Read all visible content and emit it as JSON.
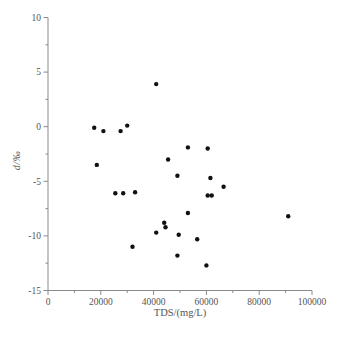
{
  "figure": {
    "background": "#ffffff"
  },
  "chart_data": {
    "type": "scatter",
    "title": "",
    "xlabel": "TDS/(mg/L)",
    "ylabel": "d/‰",
    "xlim": [
      0,
      100000
    ],
    "ylim": [
      -15,
      10
    ],
    "x_major_ticks": [
      0,
      20000,
      40000,
      60000,
      80000,
      100000
    ],
    "x_minor_ticks": [
      10000,
      30000,
      50000,
      70000,
      90000
    ],
    "y_major_ticks": [
      10,
      5,
      0,
      -5,
      -10,
      -15
    ],
    "y_minor_ticks": [
      7.5,
      2.5,
      -2.5,
      -7.5,
      -12.5
    ],
    "grid": false,
    "legend": null,
    "marker": {
      "shape": "circle",
      "color": "#111111",
      "radius_px": 2.2
    },
    "axis_color": "#8a8a8a",
    "text_color": "#555555",
    "series": [
      {
        "name": "samples",
        "points": [
          [
            17500,
            -0.1
          ],
          [
            21000,
            -0.4
          ],
          [
            27500,
            -0.4
          ],
          [
            30000,
            0.1
          ],
          [
            41000,
            3.9
          ],
          [
            18500,
            -3.5
          ],
          [
            45500,
            -3.0
          ],
          [
            53000,
            -1.9
          ],
          [
            60500,
            -2.0
          ],
          [
            49000,
            -4.5
          ],
          [
            61500,
            -4.7
          ],
          [
            66500,
            -5.5
          ],
          [
            25500,
            -6.1
          ],
          [
            28500,
            -6.1
          ],
          [
            33000,
            -6.0
          ],
          [
            60500,
            -6.3
          ],
          [
            62000,
            -6.3
          ],
          [
            53000,
            -7.9
          ],
          [
            91000,
            -8.2
          ],
          [
            44000,
            -8.8
          ],
          [
            44500,
            -9.2
          ],
          [
            41000,
            -9.7
          ],
          [
            49500,
            -9.9
          ],
          [
            56500,
            -10.3
          ],
          [
            32000,
            -11.0
          ],
          [
            49000,
            -11.8
          ],
          [
            60000,
            -12.7
          ]
        ]
      }
    ]
  }
}
